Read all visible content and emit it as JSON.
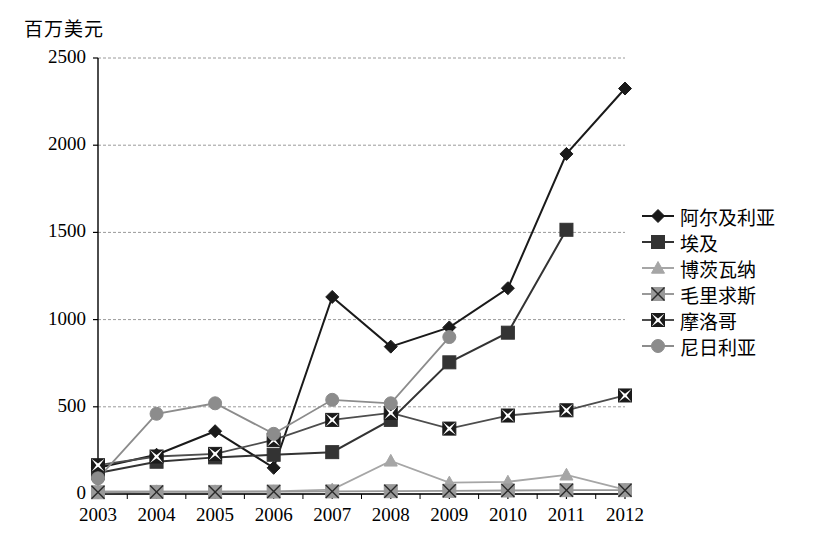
{
  "chart_data": {
    "type": "line",
    "title": "百万美元",
    "xlabel": "",
    "ylabel": "百万美元",
    "x": [
      "2003",
      "2004",
      "2005",
      "2006",
      "2007",
      "2008",
      "2009",
      "2010",
      "2011",
      "2012"
    ],
    "categories": [
      "2003",
      "2004",
      "2005",
      "2006",
      "2007",
      "2008",
      "2009",
      "2010",
      "2011",
      "2012"
    ],
    "ylim": [
      0,
      2500
    ],
    "yticks": [
      0,
      500,
      1000,
      1500,
      2000,
      2500
    ],
    "grid": true,
    "legend_position": "right",
    "series": [
      {
        "name": "阿尔及利亚",
        "color": "#1a1a1a",
        "marker": "diamond",
        "values": [
          150,
          225,
          360,
          150,
          1130,
          845,
          955,
          1180,
          1950,
          2325
        ]
      },
      {
        "name": "埃及",
        "color": "#333333",
        "marker": "square",
        "values": [
          120,
          185,
          210,
          225,
          240,
          425,
          755,
          925,
          1515,
          null
        ]
      },
      {
        "name": "博茨瓦纳",
        "color": "#a6a6a6",
        "marker": "triangle",
        "values": [
          15,
          15,
          15,
          15,
          25,
          190,
          65,
          70,
          110,
          25
        ]
      },
      {
        "name": "毛里求斯",
        "color": "#999999",
        "marker": "square-x",
        "values": [
          10,
          12,
          12,
          14,
          15,
          16,
          18,
          20,
          22,
          22
        ]
      },
      {
        "name": "摩洛哥",
        "color": "#4d4d4d",
        "marker": "x-box",
        "values": [
          165,
          215,
          230,
          310,
          425,
          465,
          375,
          450,
          480,
          565
        ]
      },
      {
        "name": "尼日利亚",
        "color": "#8c8c8c",
        "marker": "circle",
        "values": [
          90,
          460,
          520,
          345,
          540,
          520,
          900,
          null,
          null,
          null
        ]
      }
    ]
  },
  "legend": {
    "items": [
      {
        "label": "阿尔及利亚"
      },
      {
        "label": "埃及"
      },
      {
        "label": "博茨瓦纳"
      },
      {
        "label": "毛里求斯"
      },
      {
        "label": "摩洛哥"
      },
      {
        "label": "尼日利亚"
      }
    ]
  }
}
